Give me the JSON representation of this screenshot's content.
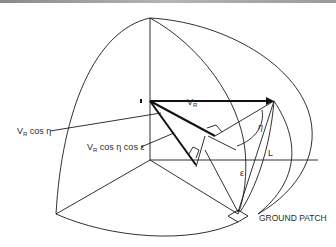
{
  "diagram": {
    "title": "",
    "labels": {
      "vr_top": "V",
      "vr_top_sub": "R",
      "vr_cos_eta": "V",
      "vr_cos_eta_sub": "R",
      "vr_cos_eta_rest": " cos η",
      "vr_cos_eta_cos_eps": "V",
      "vr_cos_eta_cos_eps_sub": "R",
      "vr_cos_eta_cos_eps_rest": " cos η cos ε",
      "eta": "η",
      "L": "L",
      "epsilon": "ε",
      "ground_patch": "GROUND PATCH"
    },
    "colors": {
      "line": "#1a1a1a",
      "text": "#2a2a2a",
      "background": "#ffffff"
    }
  }
}
